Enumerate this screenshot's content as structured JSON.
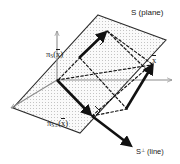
{
  "figure": {
    "background_color": "#ffffff",
    "axis_color": "#8c8c8c",
    "plane_edge_color": "#2b2b2b",
    "plane_fill_color": "#f2f2f2",
    "plane_stipple_color": "#bdbdbd",
    "vector_color": "#111111",
    "dashed_color": "#111111"
  },
  "labels": {
    "plane": {
      "symbol": "S",
      "qualifier": "(plane)",
      "name": "subspace-plane-label"
    },
    "perp_line": {
      "symbol": "S",
      "superscript": "⊥",
      "qualifier": "(line)",
      "name": "orthogonal-complement-line-label"
    },
    "projection_onto_S": {
      "pi": "π",
      "subscript": "S",
      "open": "(",
      "arg": "x",
      "close": ")",
      "name": "projection-onto-S-label"
    },
    "projection_onto_Sperp": {
      "pi": "π",
      "subscript": "S",
      "subscript_sup": "⊥",
      "open": "(",
      "arg": "x",
      "close": ")",
      "name": "projection-onto-Sperp-label"
    },
    "vector_x": {
      "arg": "x",
      "name": "vector-x-label"
    }
  },
  "geometry": {
    "origin": {
      "x": 57,
      "y": 80
    },
    "plane_polygon": "98,15 166,40 80,133 13,108",
    "axes": [
      {
        "name": "axis-up",
        "x1": 57,
        "y1": 80,
        "x2": 57,
        "y2": 29
      },
      {
        "name": "axis-right",
        "x1": 57,
        "y1": 80,
        "x2": 173,
        "y2": 80
      },
      {
        "name": "axis-left",
        "x1": 57,
        "y1": 80,
        "x2": 10,
        "y2": 109
      }
    ],
    "vectors": [
      {
        "name": "vector-x",
        "x1": 126,
        "y1": 108,
        "x2": 154,
        "y2": 63
      },
      {
        "name": "vector-projection-onto-S",
        "x1": 79,
        "y1": 57,
        "x2": 106,
        "y2": 30
      },
      {
        "name": "vector-projection-onto-Sperp",
        "x1": 57,
        "y1": 80,
        "x2": 92,
        "y2": 116
      },
      {
        "name": "line-Sperp",
        "x1": 92,
        "y1": 116,
        "x2": 132,
        "y2": 148
      }
    ],
    "dashed_edges": [
      {
        "name": "dash-x-to-projS",
        "x1": 154,
        "y1": 63,
        "x2": 106,
        "y2": 30
      },
      {
        "name": "dash-projS-to-origin",
        "x1": 106,
        "y1": 30,
        "x2": 57,
        "y2": 80
      },
      {
        "name": "dash-origin-to-x",
        "x1": 57,
        "y1": 80,
        "x2": 154,
        "y2": 63
      },
      {
        "name": "dash-projSperp-to-x",
        "x1": 92,
        "y1": 116,
        "x2": 154,
        "y2": 63
      },
      {
        "name": "dash-origin-projSp",
        "x1": 57,
        "y1": 80,
        "x2": 92,
        "y2": 116
      },
      {
        "name": "dash-top-rail",
        "x1": 106,
        "y1": 30,
        "x2": 148,
        "y2": 72
      },
      {
        "name": "dash-side-rail",
        "x1": 79,
        "y1": 57,
        "x2": 126,
        "y2": 108
      }
    ],
    "right_angle_marks": [
      {
        "name": "right-angle-at-projS",
        "x": 101,
        "y": 40
      },
      {
        "name": "right-angle-at-projSperp",
        "x": 96,
        "y": 110
      }
    ]
  }
}
